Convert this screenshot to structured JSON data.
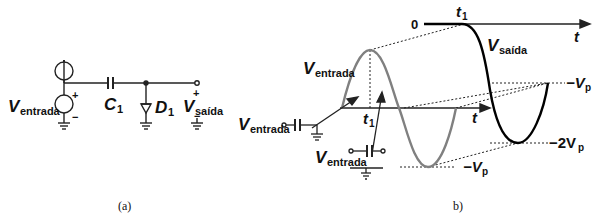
{
  "figure_a": {
    "caption": "(a)",
    "source_label": "V",
    "source_sub": "entrada",
    "source_plus": "+",
    "source_minus": "−",
    "capacitor_label": "C",
    "capacitor_sub": "1",
    "diode_label": "D",
    "diode_sub": "1",
    "output_label": "V",
    "output_sub": "saída",
    "output_plus": "+",
    "output_minus": "−"
  },
  "figure_b": {
    "caption": "b)",
    "input_wave_label": "V",
    "input_wave_sub": "entrada",
    "output_wave_label": "V",
    "output_wave_sub": "saída",
    "output_axis_zero": "0",
    "t1_top": "t",
    "t1_top_sub": "1",
    "t_top": "t",
    "t_mid": "t",
    "t1_mid": "t",
    "t1_mid_sub": "1",
    "level_minus_vp_right": "−V",
    "level_minus_vp_right_sub": "p",
    "level_minus_2vp": "−2V",
    "level_minus_2vp_sub": "p",
    "level_minus_vp_bottom": "−V",
    "level_minus_vp_bottom_sub": "p",
    "inset1_label": "V",
    "inset1_sub": "entrada",
    "inset2_label": "V",
    "inset2_sub": "entrada",
    "colors": {
      "input_wave": "#808080",
      "output_wave": "#000000",
      "axis": "#333333"
    }
  }
}
